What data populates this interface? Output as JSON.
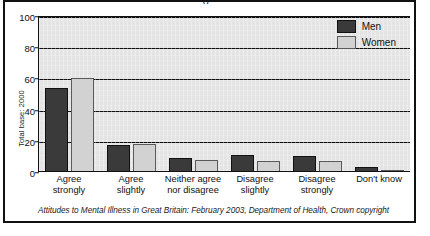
{
  "figure": {
    "ylabel": "Total base: 2000",
    "caption": "Attitudes to Mental Illness in Great Britain: February 2003, Department of Health, Crown copyright",
    "colors": {
      "men": "#3a3a3a",
      "women": "#d2d2d2",
      "plot_background": "#e4e4e4",
      "axis": "#111111"
    }
  },
  "legend": {
    "items": [
      {
        "label": "Men",
        "key": "men"
      },
      {
        "label": "Women",
        "key": "women"
      }
    ]
  },
  "axis": {
    "yticks": [
      {
        "label": "100",
        "value": 100
      },
      {
        "label": "80",
        "value": 80
      },
      {
        "label": "60",
        "value": 60
      },
      {
        "label": "40",
        "value": 40
      },
      {
        "label": "20",
        "value": 20
      },
      {
        "label": "0",
        "value": 0
      }
    ],
    "xlabels": [
      {
        "line1": "Agree",
        "line2": "strongly"
      },
      {
        "line1": "Agree",
        "line2": "slightly"
      },
      {
        "line1": "Neither agree",
        "line2": "nor disagree"
      },
      {
        "line1": "Disagree",
        "line2": "slightly"
      },
      {
        "line1": "Disagree",
        "line2": "strongly"
      },
      {
        "line1": "Don't know",
        "line2": ""
      }
    ]
  },
  "chart_data": {
    "type": "bar",
    "title": "",
    "subtitle": "",
    "xlabel": "",
    "ylabel": "Total base: 2000",
    "ylim": [
      0,
      100
    ],
    "yticks": [
      0,
      20,
      40,
      60,
      80,
      100
    ],
    "grid": true,
    "legend_position": "top-right",
    "categories": [
      "Agree strongly",
      "Agree slightly",
      "Neither agree nor disagree",
      "Disagree slightly",
      "Disagree strongly",
      "Don't know"
    ],
    "series": [
      {
        "name": "Men",
        "color": "#3a3a3a",
        "values": [
          54,
          17,
          9,
          11,
          10,
          3
        ]
      },
      {
        "name": "Women",
        "color": "#d2d2d2",
        "values": [
          60,
          18,
          8,
          7,
          7,
          1
        ]
      }
    ],
    "annotations": [
      "Attitudes to Mental Illness in Great Britain: February 2003, Department of Health, Crown copyright"
    ]
  }
}
